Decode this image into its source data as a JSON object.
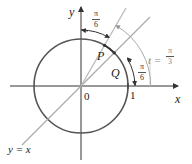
{
  "diagram": {
    "type": "unit-circle",
    "colors": {
      "axis": "#333333",
      "circle": "#555555",
      "line_y_eq_x": "#aaaaaa",
      "ray_t": "#bbbbbb",
      "arc": "#aaaaaa",
      "text": "#222222",
      "muted_text": "#888888"
    },
    "labels": {
      "y_axis": "y",
      "x_axis": "x",
      "origin": "0",
      "one": "1",
      "point_p": "P",
      "point_q": "Q",
      "line": "y = x",
      "t_prefix": "t =",
      "t_num": "π",
      "t_den": "3",
      "angle_top_num": "π",
      "angle_top_den": "6",
      "angle_right_num": "π",
      "angle_right_den": "6"
    }
  }
}
